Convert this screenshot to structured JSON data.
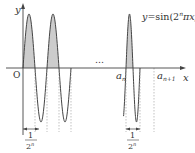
{
  "figure": {
    "function_label": "y = sin(2ⁿπx)",
    "function_label_parts": {
      "lhs": "y",
      "eq": "=",
      "fn": "sin(2",
      "exp": "n",
      "rest": "πx)"
    },
    "axis_x_label": "x",
    "axis_y_label": "y",
    "origin_label": "O",
    "ellipsis": "…",
    "point_a_n": {
      "base": "a",
      "sub": "n"
    },
    "point_a_n1": {
      "base": "a",
      "sub": "n+1"
    },
    "period_bracket_left": {
      "num": "1",
      "den_base": "2",
      "den_exp": "n"
    },
    "period_bracket_right": {
      "num": "1",
      "den_base": "2",
      "den_exp": "n"
    },
    "colors": {
      "stroke": "#444444",
      "fill": "#cccccc",
      "dash": "#999999"
    }
  }
}
